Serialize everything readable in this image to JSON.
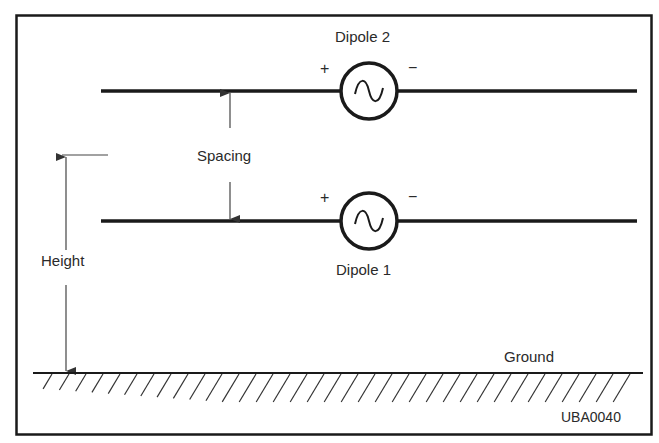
{
  "diagram": {
    "dipole2": {
      "label": "Dipole 2",
      "plus": "+",
      "minus": "−"
    },
    "dipole1": {
      "label": "Dipole 1",
      "plus": "+",
      "minus": "−"
    },
    "spacing_label": "Spacing",
    "height_label": "Height",
    "ground_label": "Ground",
    "figure_code": "UBA0040"
  },
  "colors": {
    "line": "#1a1a1a",
    "text": "#2a2a2a",
    "background": "#ffffff"
  }
}
